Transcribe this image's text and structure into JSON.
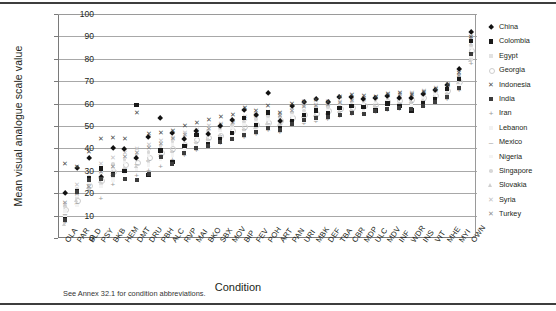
{
  "figure": {
    "caption": "See Annex 32.1 for condition abbreviations."
  },
  "chart_data": {
    "type": "scatter",
    "title": "",
    "xlabel": "Condition",
    "ylabel": "Mean visual analogue scale value",
    "ylim": [
      0,
      100
    ],
    "yticks": [
      0,
      10,
      20,
      30,
      40,
      50,
      60,
      70,
      80,
      90,
      100
    ],
    "grid": true,
    "legend_position": "right",
    "categories": [
      "OLA",
      "PAR",
      "BLD",
      "PSY",
      "BKB",
      "HEM",
      "DMT",
      "DRU",
      "PBH",
      "ALC",
      "RVP",
      "MAI",
      "BKO",
      "SBX",
      "MOV",
      "BIP",
      "FEV",
      "POH",
      "ART",
      "PAN",
      "URI",
      "MBK",
      "DEF",
      "TBA",
      "CBR",
      "MDP",
      "ULC",
      "MDV",
      "INF",
      "WDR",
      "INS",
      "VIT",
      "MHE",
      "MYI",
      "OWN"
    ],
    "series": [
      {
        "name": "China",
        "marker": "diamond",
        "color": "#111111",
        "values": [
          19.8,
          31.0,
          35.5,
          27.0,
          39.9,
          39.8,
          35.5,
          45.0,
          53.5,
          47.0,
          44.0,
          47.5,
          46.5,
          50.0,
          52.5,
          57.0,
          55.0,
          64.5,
          52.0,
          59.0,
          60.5,
          62.0,
          60.5,
          63.0,
          63.0,
          62.0,
          62.5,
          63.5,
          62.5,
          62.5,
          64.0,
          66.0,
          68.0,
          75.5,
          92.0
        ]
      },
      {
        "name": "Colombia",
        "marker": "square",
        "color": "#1a1a1a",
        "values": [
          8.5,
          21.0,
          26.5,
          31.0,
          28.5,
          30.0,
          59.5,
          28.0,
          39.0,
          34.0,
          41.0,
          46.0,
          42.0,
          44.0,
          47.0,
          53.5,
          50.5,
          56.0,
          49.0,
          52.0,
          55.0,
          57.0,
          55.5,
          58.0,
          59.0,
          58.5,
          57.0,
          60.0,
          59.0,
          57.0,
          60.0,
          62.0,
          66.5,
          71.0,
          88.0
        ]
      },
      {
        "name": "Egypt",
        "marker": "lite",
        "color": "#e2e2e2",
        "values": [
          10.0,
          18.0,
          22.0,
          24.0,
          27.0,
          30.0,
          31.0,
          33.0,
          36.0,
          38.0,
          40.0,
          42.0,
          43.0,
          45.0,
          46.5,
          48.0,
          49.0,
          50.0,
          51.0,
          52.0,
          53.0,
          54.0,
          55.0,
          56.0,
          57.0,
          57.5,
          58.0,
          59.0,
          60.0,
          60.5,
          61.0,
          62.0,
          64.0,
          68.0,
          80.0
        ]
      },
      {
        "name": "Georgia",
        "marker": "circle",
        "color": "#cdcdcd",
        "values": [
          13.0,
          17.0,
          23.5,
          26.0,
          30.0,
          33.0,
          34.0,
          36.0,
          38.5,
          40.0,
          42.0,
          44.0,
          45.0,
          46.0,
          48.0,
          50.0,
          51.0,
          52.0,
          52.5,
          54.0,
          55.5,
          56.0,
          57.0,
          58.0,
          58.5,
          59.5,
          60.0,
          61.0,
          61.5,
          62.0,
          63.0,
          64.0,
          66.0,
          70.0,
          84.0
        ]
      },
      {
        "name": "Indonesia",
        "marker": "x",
        "color": "#4a4a4a",
        "values": [
          33.0,
          32.0,
          38.5,
          44.5,
          45.0,
          44.5,
          56.0,
          46.5,
          47.0,
          48.0,
          50.0,
          51.5,
          53.0,
          54.0,
          55.0,
          58.0,
          57.0,
          59.0,
          56.0,
          60.0,
          61.0,
          62.0,
          61.0,
          63.0,
          64.0,
          63.5,
          63.0,
          64.5,
          65.0,
          64.0,
          65.5,
          66.5,
          68.5,
          74.0,
          90.0
        ]
      },
      {
        "name": "India",
        "marker": "sqdark",
        "color": "#3c3c3c",
        "values": [
          8.0,
          20.5,
          26.0,
          26.5,
          28.0,
          26.5,
          26.0,
          28.5,
          36.0,
          33.0,
          38.0,
          40.0,
          41.0,
          43.0,
          44.0,
          46.0,
          47.5,
          49.0,
          48.0,
          51.0,
          52.5,
          53.5,
          54.0,
          55.0,
          56.0,
          55.5,
          56.5,
          57.5,
          58.0,
          57.5,
          59.0,
          60.5,
          63.0,
          67.0,
          82.0
        ]
      },
      {
        "name": "Iran",
        "marker": "plus",
        "color": "#9a9a9a",
        "values": [
          7.0,
          15.0,
          21.0,
          17.5,
          24.0,
          26.0,
          28.0,
          30.0,
          32.0,
          35.0,
          37.0,
          39.0,
          41.0,
          42.0,
          44.0,
          45.0,
          46.0,
          48.0,
          47.0,
          50.0,
          51.0,
          52.0,
          53.0,
          54.0,
          55.0,
          55.5,
          56.0,
          57.0,
          57.5,
          58.0,
          58.5,
          60.0,
          62.0,
          66.0,
          78.0
        ]
      },
      {
        "name": "Lebanon",
        "marker": "blank",
        "color": "#f2f2f2",
        "values": [
          12.0,
          19.0,
          25.0,
          28.0,
          31.0,
          34.0,
          36.0,
          37.0,
          40.0,
          42.0,
          44.0,
          45.5,
          47.0,
          48.0,
          49.5,
          51.0,
          52.0,
          53.0,
          53.5,
          55.0,
          56.0,
          57.0,
          57.5,
          58.5,
          59.0,
          60.0,
          60.5,
          61.0,
          62.0,
          62.5,
          63.0,
          64.5,
          66.0,
          71.0,
          85.0
        ]
      },
      {
        "name": "Mexico",
        "marker": "dash",
        "color": "#9a9a9a",
        "values": [
          11.0,
          16.0,
          24.5,
          27.0,
          29.0,
          31.5,
          33.0,
          35.0,
          37.5,
          39.0,
          41.5,
          43.0,
          44.5,
          46.0,
          47.0,
          49.0,
          50.0,
          51.5,
          51.0,
          53.0,
          54.5,
          55.0,
          56.0,
          57.0,
          57.5,
          58.0,
          59.0,
          60.0,
          60.5,
          61.0,
          62.0,
          63.0,
          65.0,
          69.0,
          83.0
        ]
      },
      {
        "name": "Nigeria",
        "marker": "blank",
        "color": "#f4f4f4",
        "values": [
          9.0,
          14.5,
          20.0,
          23.0,
          26.0,
          29.0,
          30.5,
          32.5,
          35.0,
          37.0,
          39.5,
          41.0,
          42.5,
          44.0,
          45.0,
          47.0,
          48.0,
          49.5,
          49.0,
          51.0,
          52.0,
          53.0,
          54.0,
          55.0,
          56.0,
          56.5,
          57.0,
          58.0,
          58.5,
          59.0,
          60.0,
          61.0,
          63.5,
          68.0,
          81.0
        ]
      },
      {
        "name": "Singapore",
        "marker": "dot",
        "color": "#d8d8d8",
        "values": [
          14.0,
          22.0,
          27.5,
          30.0,
          33.0,
          35.0,
          37.0,
          38.5,
          41.0,
          43.0,
          45.0,
          46.5,
          48.0,
          49.0,
          50.5,
          52.0,
          53.0,
          54.5,
          54.0,
          56.0,
          57.0,
          58.0,
          58.5,
          59.5,
          60.5,
          61.0,
          61.5,
          62.5,
          63.0,
          63.5,
          64.0,
          65.5,
          67.0,
          72.0,
          86.0
        ]
      },
      {
        "name": "Slovakia",
        "marker": "tri",
        "color": "#cfcfcf",
        "values": [
          6.0,
          16.5,
          22.5,
          25.0,
          28.5,
          31.0,
          32.0,
          34.5,
          37.0,
          38.5,
          41.0,
          42.5,
          44.0,
          45.5,
          46.5,
          48.5,
          49.5,
          51.0,
          50.5,
          52.5,
          54.0,
          54.5,
          55.5,
          56.5,
          57.0,
          58.0,
          58.5,
          59.5,
          60.0,
          60.5,
          61.5,
          62.5,
          64.5,
          69.5,
          79.0
        ]
      },
      {
        "name": "Syria",
        "marker": "xlite",
        "color": "#c2c2c2",
        "values": [
          15.0,
          24.0,
          29.0,
          33.0,
          36.0,
          38.0,
          40.0,
          41.5,
          43.5,
          45.0,
          47.0,
          48.5,
          50.0,
          51.0,
          52.5,
          54.0,
          55.0,
          56.5,
          55.5,
          58.0,
          59.0,
          59.5,
          60.0,
          61.0,
          62.0,
          62.5,
          63.0,
          64.0,
          64.5,
          65.0,
          66.0,
          67.0,
          69.0,
          73.0,
          87.0
        ]
      },
      {
        "name": "Turkey",
        "marker": "xmid",
        "color": "#8d8d8d",
        "values": [
          16.0,
          20.0,
          23.0,
          29.5,
          32.0,
          36.5,
          38.0,
          40.5,
          42.0,
          44.5,
          46.0,
          47.5,
          49.0,
          50.5,
          51.5,
          53.5,
          54.5,
          55.5,
          54.5,
          57.0,
          58.5,
          59.0,
          59.5,
          60.5,
          61.5,
          62.0,
          62.5,
          63.5,
          64.0,
          64.5,
          65.0,
          66.0,
          68.0,
          72.5,
          89.0
        ]
      }
    ]
  }
}
